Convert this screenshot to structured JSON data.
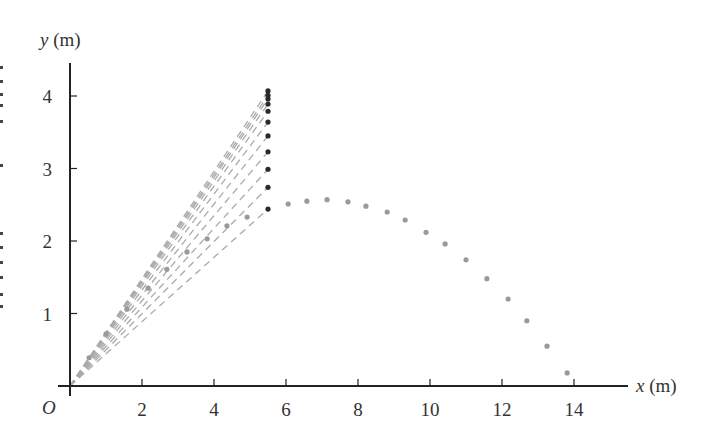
{
  "chart_data": {
    "type": "scatter",
    "title": "",
    "xlabel": "x (m)",
    "ylabel": "y (m)",
    "origin_label": "O",
    "xlim": [
      0,
      15.5
    ],
    "ylim": [
      0,
      4.5
    ],
    "x_ticks": [
      2,
      4,
      6,
      8,
      10,
      12,
      14
    ],
    "y_ticks": [
      1,
      2,
      3,
      4
    ],
    "grid": false,
    "legend": null,
    "series": [
      {
        "name": "trajectory",
        "color": "#9a9a9a",
        "marker": "dot",
        "points": [
          [
            0.53,
            0.39
          ],
          [
            1.0,
            0.72
          ],
          [
            1.58,
            1.06
          ],
          [
            2.17,
            1.35
          ],
          [
            2.69,
            1.61
          ],
          [
            3.25,
            1.85
          ],
          [
            3.81,
            2.03
          ],
          [
            4.36,
            2.21
          ],
          [
            4.92,
            2.33
          ],
          [
            6.06,
            2.51
          ],
          [
            6.58,
            2.55
          ],
          [
            7.14,
            2.57
          ],
          [
            7.72,
            2.54
          ],
          [
            8.22,
            2.48
          ],
          [
            8.81,
            2.4
          ],
          [
            9.31,
            2.29
          ],
          [
            9.89,
            2.12
          ],
          [
            10.42,
            1.96
          ],
          [
            11.0,
            1.74
          ],
          [
            11.58,
            1.48
          ],
          [
            12.17,
            1.2
          ],
          [
            12.69,
            0.9
          ],
          [
            13.25,
            0.55
          ],
          [
            13.81,
            0.18
          ]
        ]
      },
      {
        "name": "projected positions",
        "color": "#2a2a2a",
        "marker": "dot",
        "points": [
          [
            5.5,
            4.07
          ],
          [
            5.5,
            4.01
          ],
          [
            5.5,
            3.96
          ],
          [
            5.5,
            3.89
          ],
          [
            5.5,
            3.79
          ],
          [
            5.5,
            3.64
          ],
          [
            5.5,
            3.45
          ],
          [
            5.5,
            3.23
          ],
          [
            5.5,
            2.99
          ],
          [
            5.5,
            2.74
          ],
          [
            5.5,
            2.44
          ]
        ]
      },
      {
        "name": "sight lines",
        "color": "#aaaaaa",
        "style": "dashed",
        "from": [
          0,
          0
        ],
        "to_series": "projected positions"
      }
    ]
  },
  "layout": {
    "origin_px": [
      70,
      386
    ],
    "px_per_m_x": 36,
    "px_per_m_y": 72.5,
    "x_axis_end_px": 628,
    "y_axis_top_px": 63
  },
  "edge_marks_y": [
    66,
    80,
    93,
    104,
    120,
    164,
    232,
    246,
    261,
    276,
    293,
    305
  ]
}
